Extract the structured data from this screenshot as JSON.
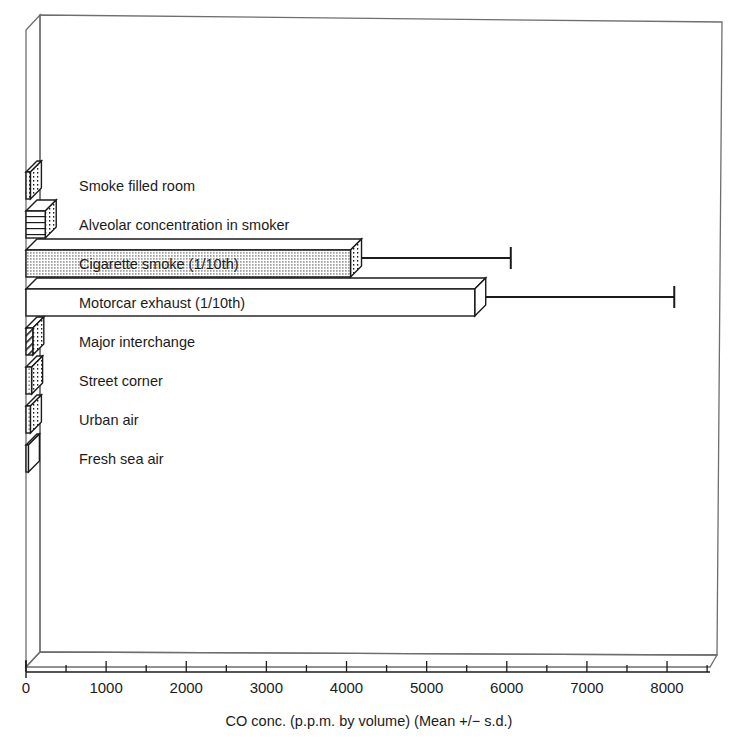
{
  "chart_data": {
    "type": "bar",
    "orientation": "horizontal",
    "title": "",
    "xlabel": "CO conc. (p.p.m. by volume) (Mean +/− s.d.)",
    "ylabel": "",
    "xlim": [
      0,
      8500
    ],
    "grid": false,
    "legend": "none",
    "xticks": [
      0,
      1000,
      2000,
      3000,
      4000,
      5000,
      6000,
      7000,
      8000
    ],
    "xtick_labels": [
      "0",
      "1000",
      "2000",
      "3000",
      "4000",
      "5000",
      "6000",
      "7000",
      "8000"
    ],
    "minor_tick_step": 500,
    "categories": [
      "Smoke filled room",
      "Alveolar concentration in smoker",
      "Cigarette smoke (1/10th)",
      "Motorcar exhaust (1/10th)",
      "Major interchange",
      "Street corner",
      "Urban air",
      "Fresh sea air"
    ],
    "values": [
      55,
      240,
      4050,
      5600,
      85,
      70,
      55,
      30
    ],
    "errors": [
      0,
      0,
      2000,
      2500,
      0,
      0,
      0,
      0
    ],
    "error_upper": [
      null,
      null,
      6050,
      8090,
      null,
      null,
      null,
      null
    ],
    "bar_fills": [
      "vertical-dotted",
      "horizontal-lines",
      "dense-dots",
      "white",
      "diagonal-hatch",
      "dots",
      "dots",
      "white"
    ]
  },
  "axis": {
    "x_title": "CO conc. (p.p.m. by volume) (Mean +/− s.d.)",
    "ticks": [
      {
        "value": "0"
      },
      {
        "value": "1000"
      },
      {
        "value": "2000"
      },
      {
        "value": "3000"
      },
      {
        "value": "4000"
      },
      {
        "value": "5000"
      },
      {
        "value": "6000"
      },
      {
        "value": "7000"
      },
      {
        "value": "8000"
      }
    ]
  },
  "bars": [
    {
      "label": "Smoke filled room"
    },
    {
      "label": "Alveolar concentration in smoker"
    },
    {
      "label": "Cigarette smoke (1/10th)"
    },
    {
      "label": "Motorcar exhaust (1/10th)"
    },
    {
      "label": "Major interchange"
    },
    {
      "label": "Street corner"
    },
    {
      "label": "Urban air"
    },
    {
      "label": "Fresh sea air"
    }
  ],
  "colors": {
    "line": "#1b1b1b",
    "frame": "#6e6e6e",
    "background": "#ffffff",
    "fill": "#ffffff"
  }
}
